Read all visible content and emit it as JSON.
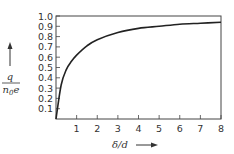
{
  "chart_data": {
    "type": "line",
    "title": "",
    "xlabel": "δ/d",
    "ylabel_numerator": "q",
    "ylabel_denominator": "n0e",
    "xlim": [
      0,
      8
    ],
    "ylim": [
      0,
      1.0
    ],
    "grid": false,
    "x_ticks": [
      "1",
      "2",
      "3",
      "4",
      "5",
      "6",
      "7",
      "8"
    ],
    "y_ticks": [
      "0.1",
      "0.2",
      "0.3",
      "0.4",
      "0.5",
      "0.6",
      "0.7",
      "0.8",
      "0.9",
      "1.0"
    ],
    "series": [
      {
        "name": "q/n0e",
        "x": [
          0,
          0.25,
          0.5,
          0.75,
          1,
          1.5,
          2,
          3,
          4,
          5,
          6,
          7,
          8
        ],
        "y": [
          0,
          0.33,
          0.48,
          0.56,
          0.62,
          0.71,
          0.77,
          0.84,
          0.88,
          0.9,
          0.92,
          0.93,
          0.94
        ]
      }
    ]
  }
}
